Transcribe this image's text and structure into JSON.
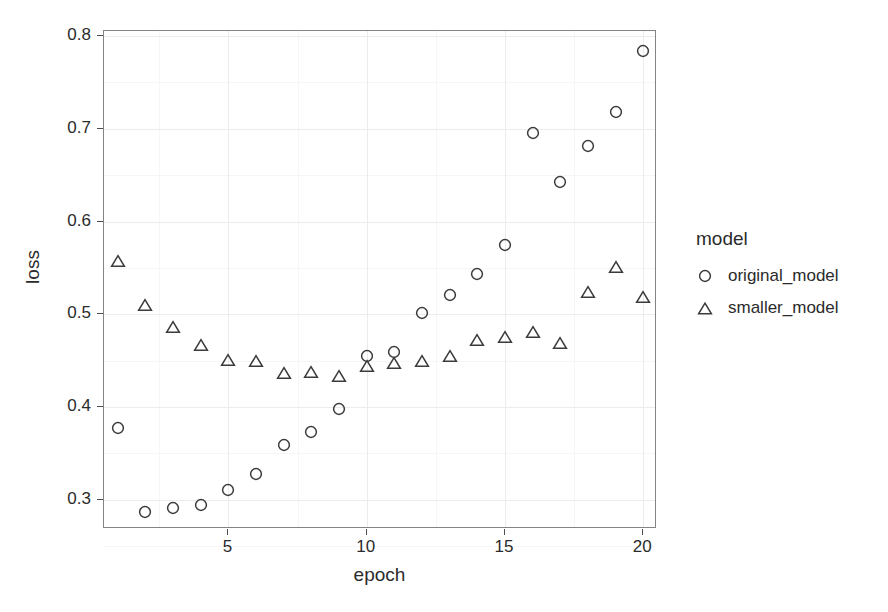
{
  "chart_data": {
    "type": "scatter",
    "title": "",
    "xlabel": "epoch",
    "ylabel": "loss",
    "xlim": [
      0.5,
      20.5
    ],
    "ylim": [
      0.2685,
      0.8055
    ],
    "grid": true,
    "legend_position": "right",
    "legend_title": "model",
    "x": [
      1,
      2,
      3,
      4,
      5,
      6,
      7,
      8,
      9,
      10,
      11,
      12,
      13,
      14,
      15,
      16,
      17,
      18,
      19,
      20
    ],
    "xticks": [
      5,
      10,
      15,
      20
    ],
    "xtick_labels": [
      "5",
      "10",
      "15",
      "20"
    ],
    "yticks": [
      0.3,
      0.4,
      0.5,
      0.6,
      0.7,
      0.8
    ],
    "ytick_labels": [
      "0.3",
      "0.4",
      "0.5",
      "0.6",
      "0.7",
      "0.8"
    ],
    "y_minor_ticks": [
      0.25,
      0.35,
      0.45,
      0.55,
      0.65,
      0.75
    ],
    "x_minor_ticks": [
      2.5,
      7.5,
      12.5,
      17.5
    ],
    "series": [
      {
        "name": "original_model",
        "marker": "circle",
        "color": "#3b3b3b",
        "values": [
          0.377,
          0.287,
          0.291,
          0.294,
          0.311,
          0.328,
          0.359,
          0.373,
          0.398,
          0.455,
          0.459,
          0.501,
          0.521,
          0.544,
          0.575,
          0.695,
          0.643,
          0.681,
          0.718,
          0.784
        ]
      },
      {
        "name": "smaller_model",
        "marker": "triangle",
        "color": "#3b3b3b",
        "values": [
          0.557,
          0.51,
          0.486,
          0.467,
          0.451,
          0.45,
          0.437,
          0.438,
          0.433,
          0.444,
          0.448,
          0.45,
          0.455,
          0.472,
          0.475,
          0.481,
          0.469,
          0.524,
          0.551,
          0.519
        ]
      }
    ]
  },
  "legend": {
    "title": "model",
    "entries": [
      {
        "label": "original_model",
        "marker": "circle-marker-icon"
      },
      {
        "label": "smaller_model",
        "marker": "triangle-marker-icon"
      }
    ]
  },
  "axes": {
    "x_title": "epoch",
    "y_title": "loss"
  },
  "style": {
    "panel_background": "#ffffff",
    "panel_border": "#848484",
    "grid_major": "#ececec",
    "grid_minor": "#f6f6f6",
    "marker_stroke": "#3b3b3b",
    "text_color": "#2b2b2b"
  }
}
